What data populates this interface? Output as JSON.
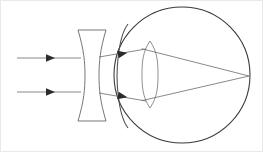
{
  "diagram": {
    "canvas": {
      "width": 263,
      "height": 152,
      "background": "#ffffff"
    },
    "frame": {
      "visible": true,
      "color": "#e9e9e9"
    },
    "colors": {
      "eyeball_outline": "#3a3a3a",
      "cornea_outline": "#4a4a4a",
      "crystalline_lens_outline": "#7c7c7c",
      "concave_lens_outline": "#6f6f6f",
      "ray_line": "#6b6b6b",
      "ray_arrowhead": "#2c2c2c"
    },
    "elements": {
      "concave_lens": {
        "label": "concave-lens",
        "type": "biconcave",
        "x_left": 78,
        "x_right": 106,
        "y_top": 30,
        "y_bottom": 121,
        "waist_inset": 7
      },
      "eyeball": {
        "label": "eyeball",
        "type": "circle",
        "cx": 182,
        "cy": 75,
        "r": 68
      },
      "cornea": {
        "label": "cornea",
        "type": "arc",
        "x_apex": 117,
        "y_top": 40,
        "y_bottom": 112
      },
      "crystalline_lens": {
        "label": "crystalline-lens",
        "type": "biconvex",
        "cx": 150,
        "y_top": 41,
        "y_bottom": 108,
        "half_width": 8
      },
      "focal_point": {
        "label": "retina-focal-point",
        "x": 249,
        "y": 76
      }
    },
    "rays": [
      {
        "name": "upper-incident-ray",
        "y": 58,
        "x_start": 17,
        "x_end": 78,
        "arrow_x": 46
      },
      {
        "name": "lower-incident-ray",
        "y": 92,
        "x_start": 17,
        "x_end": 78,
        "arrow_x": 46
      }
    ],
    "refracted_rays": [
      {
        "name": "upper-diverged-ray",
        "x1": 106,
        "y1": 57,
        "x2": 146,
        "y2": 49,
        "arrow_x": 118,
        "arrow_y": 54.6
      },
      {
        "name": "lower-diverged-ray",
        "x1": 106,
        "y1": 93,
        "x2": 146,
        "y2": 101,
        "arrow_x": 118,
        "arrow_y": 95.4
      }
    ],
    "converging_rays": [
      {
        "name": "upper-converging-ray",
        "x1": 146,
        "y1": 49,
        "x2": 249,
        "y2": 76
      },
      {
        "name": "lower-converging-ray",
        "x1": 146,
        "y1": 101,
        "x2": 249,
        "y2": 76
      }
    ]
  },
  "chart_data": {
    "type": "diagram",
    "objects": [
      {
        "name": "parallel incident rays",
        "count": 2
      },
      {
        "name": "biconcave diverging lens",
        "count": 1
      },
      {
        "name": "eyeball",
        "count": 1
      },
      {
        "name": "cornea",
        "count": 1
      },
      {
        "name": "crystalline lens",
        "count": 1
      },
      {
        "name": "focal point on retina",
        "count": 1
      }
    ]
  }
}
